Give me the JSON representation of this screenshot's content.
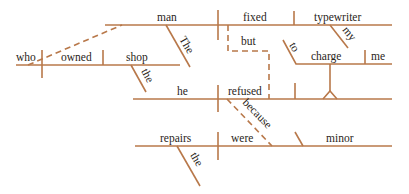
{
  "diagram": {
    "type": "sentence-diagram",
    "line_color": "#b8784a",
    "text_color": "#2a2520",
    "words": {
      "man": "man",
      "fixed": "fixed",
      "typewriter": "typewriter",
      "the_main": "The",
      "my": "my",
      "but": "but",
      "to": "to",
      "charge": "charge",
      "me": "me",
      "who": "who",
      "owned": "owned",
      "shop": "shop",
      "the_shop": "the",
      "he": "he",
      "refused": "refused",
      "because": "because",
      "repairs": "repairs",
      "were": "were",
      "minor": "minor",
      "the_repairs": "the"
    }
  }
}
